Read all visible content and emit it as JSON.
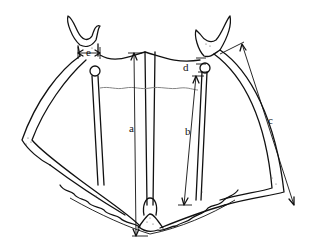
{
  "diagram": {
    "type": "anatomical-measurement-drawing",
    "labels": [
      {
        "id": "a",
        "text": "a",
        "description": "vertical central length"
      },
      {
        "id": "b",
        "text": "b",
        "description": "vertical length from condyle to lower margin"
      },
      {
        "id": "c",
        "text": "c",
        "description": "diagonal length along right lateral bar"
      },
      {
        "id": "d",
        "text": "d",
        "description": "short gap between upper process and knob"
      },
      {
        "id": "e",
        "text": "e",
        "description": "width across upper left process base"
      }
    ],
    "colors": {
      "line": "#111111",
      "background": "#ffffff",
      "wavy_line": "#777777"
    }
  }
}
